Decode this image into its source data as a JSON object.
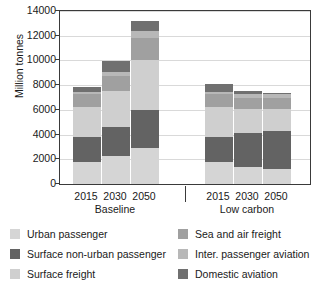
{
  "chart_data": {
    "type": "bar",
    "subtype": "stacked-grouped",
    "title": "",
    "xlabel": "",
    "ylabel": "Million tonnes",
    "ylim": [
      0,
      14000
    ],
    "ytick_step": 2000,
    "yticks": [
      0,
      2000,
      4000,
      6000,
      8000,
      10000,
      12000,
      14000
    ],
    "ytick_labels": [
      "0",
      "2000",
      "4000",
      "6000",
      "8000",
      "10000",
      "12000",
      "14000"
    ],
    "grid": true,
    "grid_axis": "y",
    "legend_position": "below",
    "groups": [
      {
        "name": "Baseline",
        "categories": [
          "2015",
          "2030",
          "2050"
        ]
      },
      {
        "name": "Low carbon",
        "categories": [
          "2015",
          "2030",
          "2050"
        ]
      }
    ],
    "categories": [
      "2015",
      "2030",
      "2050",
      "2015",
      "2030",
      "2050"
    ],
    "series": [
      {
        "name": "Urban passenger",
        "color": "#d5d5d5",
        "values": [
          1800,
          2250,
          2900,
          1800,
          1350,
          1250
        ]
      },
      {
        "name": "Surface non-urban passenger",
        "color": "#636363",
        "values": [
          2000,
          2350,
          3100,
          2000,
          2800,
          3050
        ]
      },
      {
        "name": "Surface freight",
        "color": "#cfcfcf",
        "values": [
          2400,
          2900,
          4050,
          2400,
          1900,
          1750
        ]
      },
      {
        "name": "Sea and air freight",
        "color": "#a0a0a0",
        "values": [
          1050,
          1250,
          1800,
          1050,
          950,
          950
        ]
      },
      {
        "name": "Inter. passenger aviation",
        "color": "#b8b8b8",
        "values": [
          200,
          300,
          550,
          200,
          250,
          250
        ]
      },
      {
        "name": "Domestic aviation",
        "color": "#707070",
        "values": [
          400,
          900,
          800,
          650,
          300,
          150
        ]
      }
    ],
    "totals": [
      7850,
      9950,
      13200,
      8100,
      7550,
      7400
    ],
    "legend": [
      {
        "label": "Urban passenger",
        "color": "#d5d5d5"
      },
      {
        "label": "Surface non-urban passenger",
        "color": "#636363"
      },
      {
        "label": "Surface freight",
        "color": "#cfcfcf"
      },
      {
        "label": "Sea and air freight",
        "color": "#a0a0a0"
      },
      {
        "label": "Inter. passenger aviation",
        "color": "#b8b8b8"
      },
      {
        "label": "Domestic aviation",
        "color": "#707070"
      }
    ]
  }
}
